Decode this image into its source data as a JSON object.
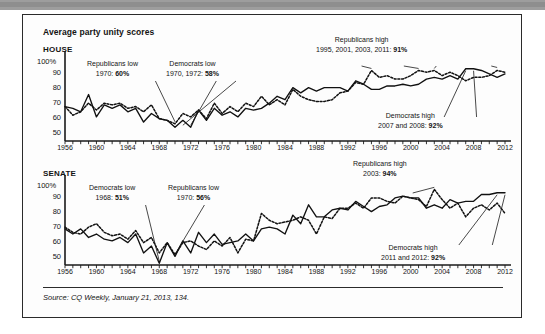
{
  "figure": {
    "title": "Average party unity scores",
    "source_prefix": "Source:",
    "source_italic": "CQ Weekly",
    "source_rest": ", January 21, 2013, 134."
  },
  "panels": [
    {
      "key": "house",
      "label": "HOUSE",
      "axis_top_label": "100%",
      "yticks": [
        "90",
        "80",
        "70",
        "60",
        "50"
      ],
      "xticks": [
        "1956",
        "1960",
        "1964",
        "1968",
        "1972",
        "1976",
        "1980",
        "1984",
        "1988",
        "1992",
        "1996",
        "2000",
        "2004",
        "2008",
        "2012"
      ],
      "annotations": [
        {
          "name": "republicans-low",
          "line1": "Republicans low",
          "line2_pre": "1970: ",
          "line2_bold": "60%"
        },
        {
          "name": "democrats-low",
          "line1": "Democrats low",
          "line2_pre": "1970, 1972: ",
          "line2_bold": "58%"
        },
        {
          "name": "republicans-high",
          "line1": "Republicans high",
          "line2_pre": "1995, 2001, 2003, 2011: ",
          "line2_bold": "91%"
        },
        {
          "name": "democrats-high",
          "line1": "Democrats high",
          "line2_pre": "2007 and 2008: ",
          "line2_bold": "92%"
        }
      ]
    },
    {
      "key": "senate",
      "label": "SENATE",
      "axis_top_label": "100%",
      "yticks": [
        "90",
        "80",
        "70",
        "60",
        "50"
      ],
      "xticks": [
        "1956",
        "1960",
        "1964",
        "1968",
        "1972",
        "1976",
        "1980",
        "1984",
        "1988",
        "1992",
        "1996",
        "2000",
        "2004",
        "2008",
        "2012"
      ],
      "annotations": [
        {
          "name": "democrats-low",
          "line1": "Democrats low",
          "line2_pre": "1968: ",
          "line2_bold": "51%"
        },
        {
          "name": "republicans-low",
          "line1": "Republicans low",
          "line2_pre": "1970: ",
          "line2_bold": "56%"
        },
        {
          "name": "republicans-high",
          "line1": "Republicans high",
          "line2_pre": "2003: ",
          "line2_bold": "94%"
        },
        {
          "name": "democrats-high",
          "line1": "Democrats high",
          "line2_pre": "2011 and 2012: ",
          "line2_bold": "92%"
        }
      ]
    }
  ],
  "chart_data": [
    {
      "type": "line",
      "id": "house",
      "title": "HOUSE",
      "xlabel": "",
      "ylabel": "",
      "ylim": [
        50,
        100
      ],
      "yticks": [
        50,
        60,
        70,
        80,
        90,
        100
      ],
      "xlim": [
        1956,
        2012
      ],
      "xtick_step": 1,
      "xlabel_step": 4,
      "grid": false,
      "legend": "none",
      "x": [
        1956,
        1957,
        1958,
        1959,
        1960,
        1961,
        1962,
        1963,
        1964,
        1965,
        1966,
        1967,
        1968,
        1969,
        1970,
        1971,
        1972,
        1973,
        1974,
        1975,
        1976,
        1977,
        1978,
        1979,
        1980,
        1981,
        1982,
        1983,
        1984,
        1985,
        1986,
        1987,
        1988,
        1989,
        1990,
        1991,
        1992,
        1993,
        1994,
        1995,
        1996,
        1997,
        1998,
        1999,
        2000,
        2001,
        2002,
        2003,
        2004,
        2005,
        2006,
        2007,
        2008,
        2009,
        2010,
        2011,
        2012
      ],
      "series": [
        {
          "name": "Democrats",
          "style": "solid",
          "values": [
            70,
            69,
            67,
            77,
            64,
            71,
            69,
            71,
            67,
            69,
            61,
            66,
            63,
            62,
            58,
            62,
            58,
            68,
            62,
            69,
            65,
            67,
            64,
            69,
            68,
            69,
            72,
            76,
            74,
            81,
            78,
            81,
            79,
            81,
            81,
            81,
            79,
            85,
            83,
            80,
            80,
            82,
            82,
            83,
            82,
            83,
            86,
            87,
            86,
            88,
            86,
            92,
            92,
            91,
            89,
            87,
            89
          ]
        },
        {
          "name": "Republicans",
          "style": "dotted",
          "values": [
            70,
            65,
            67,
            72,
            68,
            72,
            71,
            72,
            69,
            70,
            67,
            71,
            63,
            62,
            60,
            66,
            64,
            68,
            63,
            72,
            66,
            70,
            67,
            72,
            70,
            76,
            71,
            74,
            71,
            80,
            76,
            74,
            73,
            73,
            74,
            78,
            79,
            84,
            83,
            91,
            87,
            88,
            86,
            86,
            88,
            91,
            90,
            91,
            88,
            90,
            88,
            85,
            87,
            87,
            88,
            91,
            90
          ]
        }
      ],
      "annotations": [
        {
          "text": "Republicans low 1970: 60%",
          "x": 1970,
          "y": 60
        },
        {
          "text": "Democrats low 1970, 1972: 58%",
          "x": 1972,
          "y": 58
        },
        {
          "text": "Republicans high 1995, 2001, 2003, 2011: 91%",
          "x": 1995,
          "y": 91
        },
        {
          "text": "Democrats high 2007 and 2008: 92%",
          "x": 2008,
          "y": 92
        }
      ]
    },
    {
      "type": "line",
      "id": "senate",
      "title": "SENATE",
      "xlabel": "",
      "ylabel": "",
      "ylim": [
        50,
        100
      ],
      "yticks": [
        50,
        60,
        70,
        80,
        90,
        100
      ],
      "xlim": [
        1956,
        2012
      ],
      "xtick_step": 1,
      "xlabel_step": 4,
      "grid": false,
      "legend": "none",
      "x": [
        1956,
        1957,
        1958,
        1959,
        1960,
        1961,
        1962,
        1963,
        1964,
        1965,
        1966,
        1967,
        1968,
        1969,
        1970,
        1971,
        1972,
        1973,
        1974,
        1975,
        1976,
        1977,
        1978,
        1979,
        1980,
        1981,
        1982,
        1983,
        1984,
        1985,
        1986,
        1987,
        1988,
        1989,
        1990,
        1991,
        1992,
        1993,
        1994,
        1995,
        1996,
        1997,
        1998,
        1999,
        2000,
        2001,
        2002,
        2003,
        2004,
        2005,
        2006,
        2007,
        2008,
        2009,
        2010,
        2011,
        2012
      ],
      "series": [
        {
          "name": "Democrats",
          "style": "solid",
          "values": [
            71,
            68,
            71,
            66,
            68,
            65,
            64,
            66,
            63,
            68,
            57,
            61,
            51,
            63,
            55,
            64,
            57,
            69,
            63,
            68,
            62,
            63,
            64,
            68,
            64,
            71,
            72,
            71,
            68,
            79,
            74,
            85,
            78,
            78,
            82,
            83,
            82,
            87,
            84,
            81,
            84,
            85,
            89,
            90,
            89,
            89,
            83,
            85,
            83,
            88,
            86,
            87,
            87,
            91,
            91,
            92,
            92
          ]
        },
        {
          "name": "Republicans",
          "style": "dotted",
          "values": [
            72,
            69,
            68,
            72,
            74,
            69,
            67,
            68,
            65,
            70,
            63,
            66,
            57,
            63,
            56,
            63,
            64,
            61,
            59,
            64,
            61,
            66,
            57,
            65,
            64,
            80,
            76,
            74,
            75,
            76,
            78,
            76,
            68,
            78,
            77,
            83,
            83,
            86,
            83,
            89,
            89,
            87,
            86,
            90,
            89,
            88,
            84,
            94,
            88,
            83,
            86,
            78,
            83,
            85,
            82,
            86,
            80
          ]
        }
      ],
      "annotations": [
        {
          "text": "Democrats low 1968: 51%",
          "x": 1968,
          "y": 51
        },
        {
          "text": "Republicans low 1970: 56%",
          "x": 1970,
          "y": 56
        },
        {
          "text": "Republicans high 2003: 94%",
          "x": 2003,
          "y": 94
        },
        {
          "text": "Democrats high 2011 and 2012: 92%",
          "x": 2012,
          "y": 92
        }
      ]
    }
  ]
}
